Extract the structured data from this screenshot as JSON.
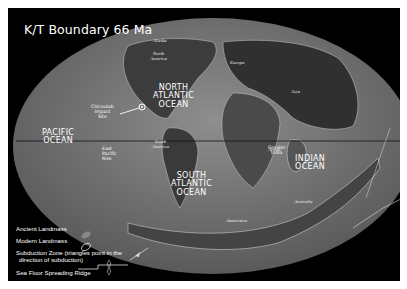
{
  "title": "K/T Boundary 66 Ma",
  "oceans": {
    "north_atlantic": [
      "NORTH",
      "ATLANTIC",
      "OCEAN"
    ],
    "pacific": [
      "PACIFIC",
      "OCEAN"
    ],
    "south_atlantic": [
      "SOUTH",
      "ATLANTIC",
      "OCEAN"
    ],
    "indian": [
      "INDIAN",
      "OCEAN"
    ]
  },
  "continents": {
    "alaska": "Alaska",
    "north_america": [
      "North",
      "America"
    ],
    "europe": "Europe",
    "asia": "Asia",
    "africa": "Africa",
    "south_america": [
      "South",
      "America"
    ],
    "greater_india": [
      "Greater",
      "India"
    ],
    "australia": "Australia",
    "antarctica": "Antarctica"
  },
  "features": {
    "chicxulub": [
      "Chicxulub",
      "Impact",
      "Site"
    ],
    "east_pacific_rise": [
      "East",
      "Pacific",
      "Rise"
    ]
  },
  "legend": {
    "ancient_landmass": "Ancient Landmass",
    "modern_landmass": "Modern Landmass",
    "subduction_zone": [
      "Subduction Zone (triangles point in the",
      "direction of subduction)"
    ],
    "spreading_ridge": "Sea Floor Spreading Ridge"
  },
  "colors": {
    "background": "#000000",
    "ocean": "#7a7a7a",
    "land": "#3a3a3a",
    "text": "#ffffff"
  }
}
